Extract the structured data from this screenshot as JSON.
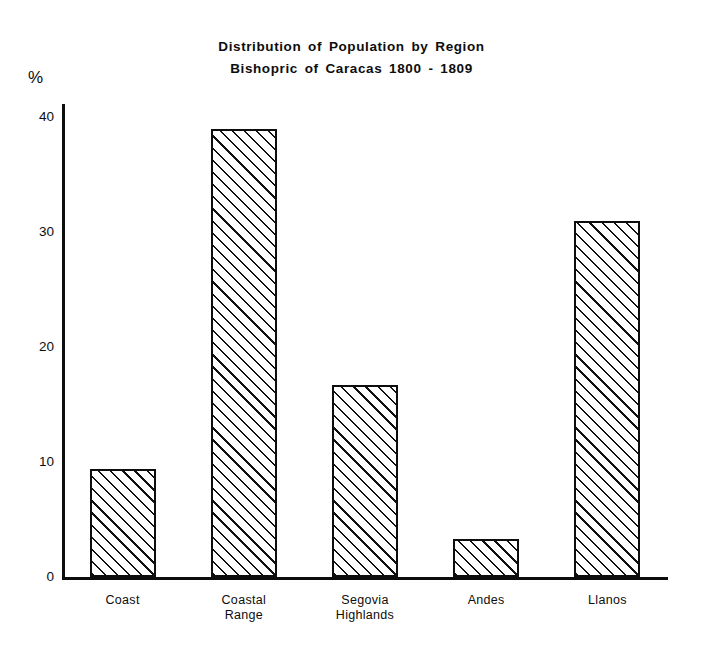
{
  "chart_data": {
    "type": "bar",
    "title": "Distribution of Population by Region",
    "subtitle": "Bishopric of Caracas 1800 - 1809",
    "xlabel": "",
    "ylabel": "%",
    "ylim": [
      0,
      42
    ],
    "yticks": [
      0,
      10,
      20,
      30,
      40
    ],
    "ytick_labels": [
      "0",
      "10",
      "20",
      "30",
      "40"
    ],
    "grid": false,
    "legend": false,
    "categories": [
      "Coast",
      "Coastal Range",
      "Segovia Highlands",
      "Andes",
      "Llanos"
    ],
    "category_lines": [
      [
        "Coast"
      ],
      [
        "Coastal",
        "Range"
      ],
      [
        "Segovia",
        "Highlands"
      ],
      [
        "Andes"
      ],
      [
        "Llanos"
      ]
    ],
    "values": [
      9.4,
      39.0,
      16.7,
      3.3,
      31.0
    ],
    "bar_fill": "diagonal-hatch",
    "bar_edge_color": "#0d0d0d",
    "background_color": "#ffffff"
  },
  "titles": {
    "line1": "Distribution of Population by Region",
    "line2": "Bishopric of Caracas 1800 - 1809"
  },
  "axis": {
    "unit_label": "%"
  }
}
